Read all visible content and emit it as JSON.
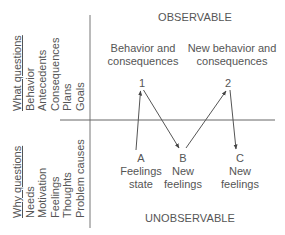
{
  "diagram": {
    "top_section_label": "OBSERVABLE",
    "bottom_section_label": "UNOBSERVABLE",
    "left_top_column": {
      "heading": "What questions",
      "items": [
        "Behavior",
        "Antecedents",
        "Consequences",
        "Plans",
        "Goals"
      ]
    },
    "left_bottom_column": {
      "heading": "Why questions",
      "items": [
        "Needs",
        "Motivation",
        "Feelings",
        "Thoughts",
        "Problem causes"
      ]
    },
    "observable_captions": [
      {
        "line1": "Behavior and",
        "line2": "consequences"
      },
      {
        "line1": "New behavior and",
        "line2": "consequences"
      }
    ],
    "observable_nodes": [
      {
        "id": "1",
        "label": "1"
      },
      {
        "id": "2",
        "label": "2"
      }
    ],
    "unobservable_nodes": [
      {
        "id": "A",
        "label": "A",
        "line1": "Feelings",
        "line2": "state"
      },
      {
        "id": "B",
        "label": "B",
        "line1": "New",
        "line2": "feelings"
      },
      {
        "id": "C",
        "label": "C",
        "line1": "New",
        "line2": "feelings"
      }
    ],
    "edges": [
      {
        "from": "A",
        "to": "1"
      },
      {
        "from": "1",
        "to": "B"
      },
      {
        "from": "B",
        "to": "2"
      },
      {
        "from": "2",
        "to": "C"
      }
    ],
    "colors": {
      "line": "#555555",
      "text": "#555555",
      "background": "#ffffff"
    }
  }
}
